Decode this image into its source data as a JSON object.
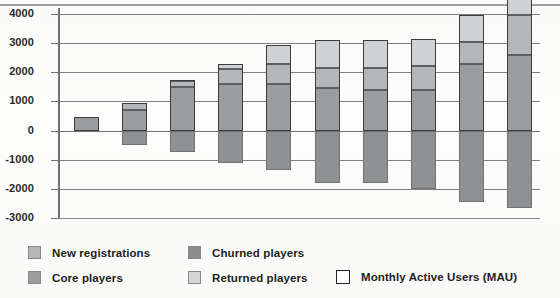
{
  "chart_data": {
    "type": "bar",
    "subtype": "stacked-bar-with-negatives",
    "title": "",
    "xlabel": "",
    "ylabel": "",
    "ylim": [
      -3000,
      4000
    ],
    "ytick_step": 1000,
    "ytick_labels": [
      "4000",
      "3000",
      "2000",
      "1000",
      "0",
      "-1000",
      "-2000",
      "-3000"
    ],
    "ytick_values": [
      4000,
      3000,
      2000,
      1000,
      0,
      -1000,
      -2000,
      -3000
    ],
    "grid": true,
    "legend_position": "bottom",
    "categories": [
      "1",
      "2",
      "3",
      "4",
      "5",
      "6",
      "7",
      "8",
      "9",
      "10"
    ],
    "series": [
      {
        "name": "Core players",
        "color": "#9a9c9e",
        "values": [
          450,
          700,
          1500,
          1600,
          1600,
          1450,
          1400,
          1400,
          2300,
          2600
        ]
      },
      {
        "name": "New registrations",
        "color": "#b4b6b7",
        "values": [
          0,
          250,
          200,
          500,
          700,
          700,
          750,
          800,
          750,
          1350
        ]
      },
      {
        "name": "Returned players",
        "color": "#cfd1d2",
        "values": [
          0,
          0,
          50,
          200,
          650,
          950,
          950,
          950,
          900,
          850
        ]
      },
      {
        "name": "Churned players",
        "color": "#8e9092",
        "values": [
          0,
          -500,
          -750,
          -1100,
          -1350,
          -1800,
          -1800,
          -2000,
          -2450,
          -2650
        ]
      }
    ],
    "mau_outline": {
      "name": "Monthly Active Users (MAU)",
      "color": "#ffffff",
      "values": [
        450,
        950,
        1750,
        2300,
        2950,
        3100,
        3100,
        3150,
        3950,
        4800
      ]
    }
  },
  "legend": {
    "items": [
      {
        "label": "New registrations",
        "swatch": "newreg"
      },
      {
        "label": "Churned players",
        "swatch": "churn"
      },
      {
        "label": "Core players",
        "swatch": "core"
      },
      {
        "label": "Returned players",
        "swatch": "returned"
      },
      {
        "label": "Monthly Active Users (MAU)",
        "swatch": "mau"
      }
    ]
  }
}
